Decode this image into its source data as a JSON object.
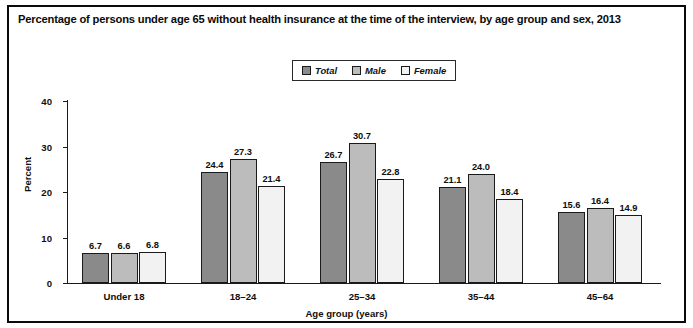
{
  "figure": {
    "title": "Percentage of persons under age 65 without health insurance at the time of the interview, by age group and sex, 2013"
  },
  "legend": {
    "position": "top-center",
    "entries": [
      {
        "label": "Total",
        "color": "#8a8a8a"
      },
      {
        "label": "Male",
        "color": "#bcbcbc"
      },
      {
        "label": "Female",
        "color": "#f2f2f2"
      }
    ]
  },
  "axes": {
    "ylabel": "Percent",
    "xlabel": "Age group (years)",
    "yticks": [
      "0",
      "10",
      "20",
      "30",
      "40"
    ]
  },
  "chart_data": {
    "type": "bar",
    "title": "Percentage of persons under age 65 without health insurance at the time of the interview, by age group and sex, 2013",
    "xlabel": "Age group (years)",
    "ylabel": "Percent",
    "ylim": [
      0,
      40
    ],
    "ytick_values": [
      0,
      10,
      20,
      30,
      40
    ],
    "grid": false,
    "legend_position": "top-center",
    "categories": [
      "Under 18",
      "18–24",
      "25–34",
      "35–44",
      "45–64"
    ],
    "series": [
      {
        "name": "Total",
        "color": "#8a8a8a",
        "values": [
          6.7,
          24.4,
          26.7,
          21.1,
          15.6
        ],
        "labels": [
          "6.7",
          "24.4",
          "26.7",
          "21.1",
          "15.6"
        ]
      },
      {
        "name": "Male",
        "color": "#bcbcbc",
        "values": [
          6.6,
          27.3,
          30.7,
          24.0,
          16.4
        ],
        "labels": [
          "6.6",
          "27.3",
          "30.7",
          "24.0",
          "16.4"
        ]
      },
      {
        "name": "Female",
        "color": "#f2f2f2",
        "values": [
          6.8,
          21.4,
          22.8,
          18.4,
          14.9
        ],
        "labels": [
          "6.8",
          "21.4",
          "22.8",
          "18.4",
          "14.9"
        ]
      }
    ]
  }
}
